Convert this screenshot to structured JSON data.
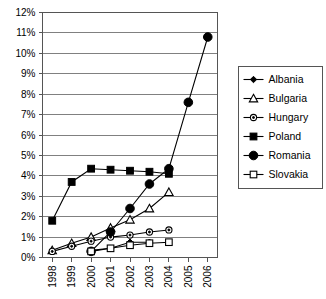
{
  "chart_data": {
    "type": "line",
    "title": "",
    "xlabel": "",
    "ylabel": "",
    "categories": [
      "1998",
      "1999",
      "2000",
      "2001",
      "2002",
      "2003",
      "2004",
      "2005",
      "2006"
    ],
    "ytick_labels": [
      "0%",
      "1%",
      "2%",
      "3%",
      "4%",
      "5%",
      "6%",
      "7%",
      "8%",
      "9%",
      "10%",
      "11%",
      "12%"
    ],
    "ytick_values": [
      0,
      1,
      2,
      3,
      4,
      5,
      6,
      7,
      8,
      9,
      10,
      11,
      12
    ],
    "ylim": [
      0,
      12
    ],
    "grid": true,
    "legend_position": "right",
    "series": [
      {
        "name": "Albania",
        "marker": "small-filled-diamond",
        "x": [
          "2000",
          "2001",
          "2002",
          "2003"
        ],
        "values": [
          0.35,
          0.45,
          0.75,
          0.75
        ]
      },
      {
        "name": "Bulgaria",
        "marker": "open-triangle",
        "x": [
          "1998",
          "1999",
          "2000",
          "2001",
          "2002",
          "2003",
          "2004"
        ],
        "values": [
          0.35,
          0.7,
          1.0,
          1.45,
          1.85,
          2.4,
          3.2
        ]
      },
      {
        "name": "Hungary",
        "marker": "open-circle",
        "x": [
          "1998",
          "1999",
          "2000",
          "2001",
          "2002",
          "2003",
          "2004"
        ],
        "values": [
          0.3,
          0.55,
          0.8,
          1.0,
          1.1,
          1.25,
          1.35
        ]
      },
      {
        "name": "Poland",
        "marker": "filled-square",
        "x": [
          "1998",
          "1999",
          "2000",
          "2001",
          "2002",
          "2003",
          "2004"
        ],
        "values": [
          1.8,
          3.7,
          4.35,
          4.3,
          4.25,
          4.2,
          4.1
        ]
      },
      {
        "name": "Romania",
        "marker": "large-filled-circle",
        "x": [
          "2000",
          "2001",
          "2002",
          "2003",
          "2004",
          "2005",
          "2006"
        ],
        "values": [
          0.3,
          1.25,
          2.4,
          3.6,
          4.35,
          7.6,
          10.8
        ]
      },
      {
        "name": "Slovakia",
        "marker": "open-square",
        "x": [
          "2000",
          "2001",
          "2002",
          "2003",
          "2004"
        ],
        "values": [
          0.3,
          0.45,
          0.6,
          0.7,
          0.75
        ]
      }
    ]
  }
}
